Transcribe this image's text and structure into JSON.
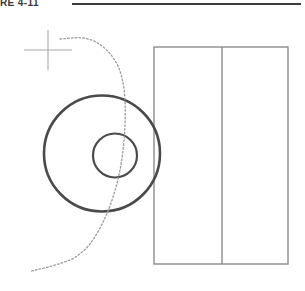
{
  "page": {
    "width": 305,
    "height": 291,
    "background": "#ffffff",
    "caption": "RE 4-11"
  },
  "colors": {
    "rule": "#3d3d3d",
    "circle_stroke": "#4a4a4a",
    "rect_stroke": "#8c8c8c",
    "dotted_stroke": "#9a9a9a",
    "crosshair_stroke": "#a8a8a8",
    "caption_text": "#3a3a3a"
  },
  "elements": {
    "header_rule": {
      "label": "header-rule",
      "x1": 72,
      "y1": 4,
      "x2": 301,
      "y2": 4,
      "stroke_width": 2.2
    },
    "crosshair": {
      "label": "crosshair-marker",
      "center_x": 48,
      "center_y": 50,
      "vertical": {
        "x": 48,
        "y1": 30,
        "y2": 70
      },
      "horizontal": {
        "y": 50,
        "x1": 24,
        "x2": 72
      },
      "stroke_width": 1.1
    },
    "outer_circle": {
      "label": "outer-circle",
      "cx": 102,
      "cy": 153.5,
      "r": 58,
      "stroke_width": 2.6
    },
    "inner_circle": {
      "label": "inner-circle",
      "cx": 115,
      "cy": 155.5,
      "r": 22,
      "stroke_width": 2.2
    },
    "rectangle": {
      "label": "divided-rectangle",
      "x": 154,
      "y": 47,
      "width": 134,
      "height": 217,
      "stroke_width": 1.4
    },
    "rect_divider": {
      "label": "rectangle-divider",
      "x": 222,
      "y1": 47,
      "y2": 264,
      "stroke_width": 1.4
    },
    "dotted_curve": {
      "label": "dotted-trace-curve",
      "stroke_width": 1.3,
      "dash_pattern": "1.6 2.2",
      "path": "M 60 39 L 72 38 Q 85 36.5 96 42 Q 110 50 118 66 Q 124 80 125 100 Q 126 125 123 150 Q 120 178 111 203 Q 103 226 90 244 Q 82 254 70 260 Q 55 266 31 271"
    }
  },
  "chart_data": {
    "type": "line",
    "title": "RE 4-11",
    "xlabel": "",
    "ylabel": "",
    "series": [
      {
        "name": "dotted trace curve",
        "x": [
          60,
          72,
          85,
          96,
          110,
          118,
          125,
          123,
          111,
          90,
          70,
          31
        ],
        "y": [
          39,
          38,
          36.5,
          42,
          50,
          66,
          100,
          150,
          203,
          244,
          260,
          271
        ]
      }
    ],
    "annotations": [
      {
        "name": "crosshair-marker",
        "x": 48,
        "y": 50
      },
      {
        "name": "outer-circle",
        "cx": 102,
        "cy": 153.5,
        "r": 58
      },
      {
        "name": "inner-circle",
        "cx": 115,
        "cy": 155.5,
        "r": 22
      },
      {
        "name": "divided-rectangle",
        "x": 154,
        "y": 47,
        "w": 134,
        "h": 217
      }
    ],
    "grid": false,
    "legend": "none"
  }
}
